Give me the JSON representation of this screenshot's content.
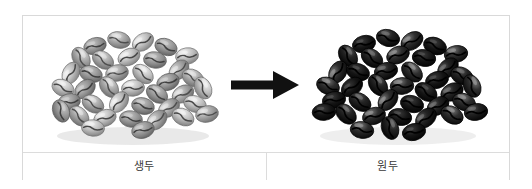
{
  "figure": {
    "type": "comparison-figure",
    "arrow": {
      "icon": "arrow-right-icon",
      "direction": "right",
      "color": "#111111"
    },
    "panels": [
      {
        "id": "green",
        "caption": "생두",
        "image_alt": "green-coffee-beans-pile",
        "palette": {
          "bean_base": "#8d8d8d",
          "bean_light": "#d8d8d8",
          "bean_highlight": "#f0f0f0",
          "bean_shadow": "#5a5a5a",
          "crease": "#4a4a4a"
        }
      },
      {
        "id": "roasted",
        "caption": "원두",
        "image_alt": "roasted-coffee-beans-pile",
        "palette": {
          "bean_base": "#1a1a1a",
          "bean_light": "#3d3d3d",
          "bean_highlight": "#9a9a9a",
          "bean_shadow": "#000000",
          "crease": "#000000"
        }
      }
    ],
    "border_color": "#d9d9d9",
    "divider_color": "#dcdcdc",
    "background_color": "#ffffff"
  }
}
